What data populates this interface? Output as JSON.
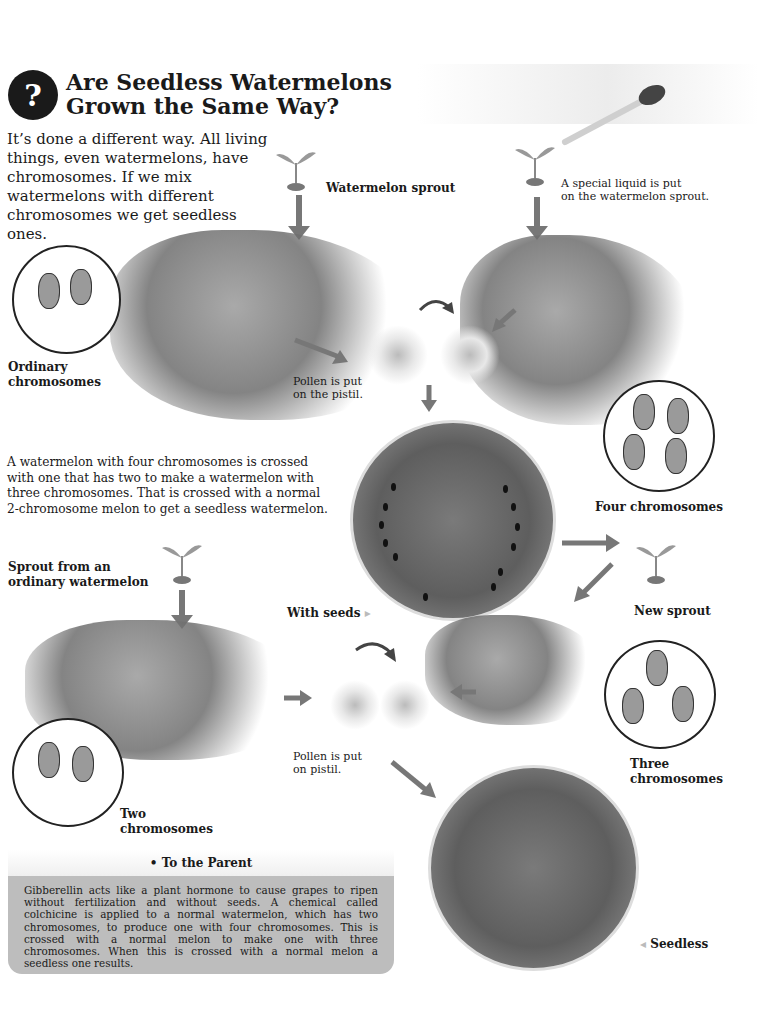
{
  "header": {
    "icon": "question-exclamation-icon",
    "title_line1": "Are Seedless Watermelons",
    "title_line2": "Grown the Same Way?"
  },
  "intro": "It’s done a different way. All living things, even watermelons, have chromosomes. If we mix watermelons with different chromosomes we get seedless ones.",
  "labels": {
    "watermelon_sprout": "Watermelon sprout",
    "special_liquid_1": "A special liquid is put",
    "special_liquid_2": "on the watermelon sprout.",
    "ordinary_1": "Ordinary",
    "ordinary_2": "chromosomes",
    "pollen_1_line1": "Pollen is put",
    "pollen_1_line2": "on the pistil.",
    "four_chromosomes": "Four chromosomes",
    "new_sprout": "New sprout",
    "with_seeds": "With seeds",
    "sprout_ordinary_1": "Sprout from an",
    "sprout_ordinary_2": "ordinary watermelon",
    "pollen_2_line1": "Pollen is put",
    "pollen_2_line2": "on pistil.",
    "three_1": "Three",
    "three_2": "chromosomes",
    "two_1": "Two",
    "two_2": "chromosomes",
    "seedless": "Seedless",
    "pointer_right": "▸",
    "pointer_left": "◂"
  },
  "middle_paragraph": "A watermelon with four chromosomes is crossed with one that has two to make a watermelon with three chromosomes. That is crossed with a normal 2-chromosome melon to get a seedless watermelon.",
  "to_the_parent": {
    "heading": "• To the Parent",
    "body": "Gibberellin acts like a plant hormone to cause grapes to ripen without fertilization and without seeds. A chemical called colchicine is applied to a normal watermelon, which has two chromosomes, to produce one with four chromosomes. This is crossed with a normal melon to make one with three chromosomes. When this is crossed with a normal melon a seedless one results."
  },
  "colors": {
    "arrow": "#777777",
    "parent_box": "#bdbdbd",
    "text": "#1a1a1a"
  }
}
